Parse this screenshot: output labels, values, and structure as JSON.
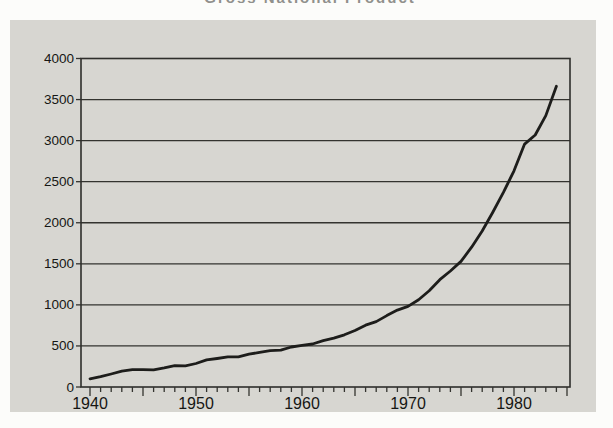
{
  "figure": {
    "clipped_title_note": "title mostly cut off at top edge of image",
    "y_axis_title_line1": "Billions of",
    "y_axis_title_line2": "Dollars"
  },
  "colors": {
    "page_bg": "#fcfcfa",
    "panel_bg": "#d7d6d1",
    "frame": "#2e2e2b",
    "grid": "#33332f",
    "line": "#1d1d1b",
    "text": "#161614"
  },
  "chart_data": {
    "type": "line",
    "title": "Gross National Product",
    "xlabel": "",
    "ylabel": "Billions of Dollars",
    "ylabel_lines": [
      "Billions of",
      "Dollars"
    ],
    "xlim": [
      1940,
      1985
    ],
    "ylim": [
      0,
      4000
    ],
    "grid": "horizontal",
    "legend": "none",
    "y_ticks": [
      0,
      500,
      1000,
      1500,
      2000,
      2500,
      3000,
      3500,
      4000
    ],
    "x_labeled_ticks": [
      1940,
      1950,
      1960,
      1970,
      1980
    ],
    "x_minor_tick_step_years": 1,
    "x_major_tick_step_years": 5,
    "series": [
      {
        "name": "GNP, billions of current dollars",
        "x": [
          1940,
          1941,
          1942,
          1943,
          1944,
          1945,
          1946,
          1947,
          1948,
          1949,
          1950,
          1951,
          1952,
          1953,
          1954,
          1955,
          1956,
          1957,
          1958,
          1959,
          1960,
          1961,
          1962,
          1963,
          1964,
          1965,
          1966,
          1967,
          1968,
          1969,
          1970,
          1971,
          1972,
          1973,
          1974,
          1975,
          1976,
          1977,
          1978,
          1979,
          1980,
          1981,
          1982,
          1983,
          1984
        ],
        "values": [
          100,
          125,
          158,
          192,
          211,
          212,
          210,
          233,
          259,
          258,
          286,
          330,
          347,
          366,
          366,
          399,
          421,
          443,
          449,
          487,
          506,
          523,
          564,
          595,
          636,
          688,
          753,
          796,
          869,
          936,
          982,
          1063,
          1171,
          1307,
          1413,
          1529,
          1702,
          1900,
          2128,
          2369,
          2632,
          2958,
          3069,
          3305,
          3663
        ]
      }
    ]
  }
}
